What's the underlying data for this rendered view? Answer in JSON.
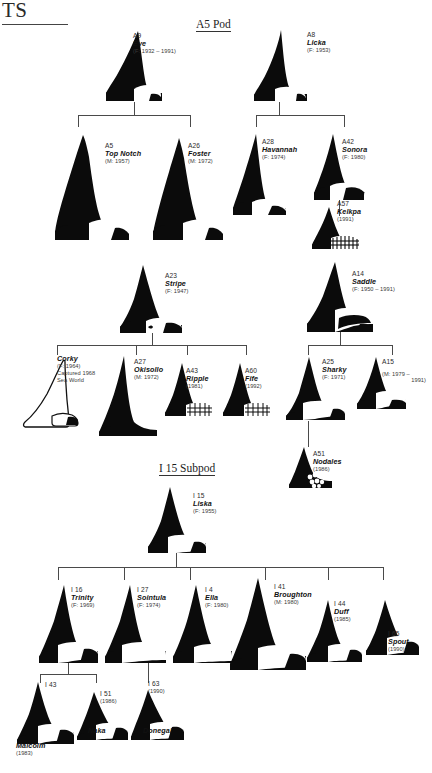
{
  "page": {
    "header_fragment": "TS",
    "section_titles": {
      "a5_pod": "A5 Pod",
      "i15_subpod": "I 15 Subpod"
    }
  },
  "whales": {
    "a9": {
      "id": "A9",
      "name": "Eve",
      "years": "(F: 1932 – 1991)"
    },
    "a8": {
      "id": "A8",
      "name": "Licka",
      "years": "(F: 1953)"
    },
    "a5": {
      "id": "A5",
      "name": "Top Notch",
      "years": "(M: 1957)"
    },
    "a26": {
      "id": "A26",
      "name": "Foster",
      "years": "(M: 1972)"
    },
    "a28": {
      "id": "A28",
      "name": "Havannah",
      "years": "(F: 1974)"
    },
    "a42": {
      "id": "A42",
      "name": "Sonora",
      "years": "(F: 1980)"
    },
    "a57": {
      "id": "A57",
      "name": "Kelkpa",
      "years": "(1991)"
    },
    "a23": {
      "id": "A23",
      "name": "Stripe",
      "years": "(F: 1947)"
    },
    "a14": {
      "id": "A14",
      "name": "Saddle",
      "years": "(F: 1950 – 1991)"
    },
    "corky": {
      "id": "",
      "name": "Corky",
      "years": "(F: 1964)",
      "note1": "Captured 1968",
      "note2": "Sea World"
    },
    "a27": {
      "id": "A27",
      "name": "Okisollo",
      "years": "(M: 1972)"
    },
    "a43": {
      "id": "A43",
      "name": "Ripple",
      "years": "(1981)"
    },
    "a60": {
      "id": "A60",
      "name": "Fife",
      "years": "(1992)"
    },
    "a25": {
      "id": "A25",
      "name": "Sharky",
      "years": "(F: 1971)"
    },
    "a15": {
      "id": "A15",
      "name": "",
      "years": "(M: 1979 –",
      "years2": "1991)"
    },
    "a51": {
      "id": "A51",
      "name": "Nodales",
      "years": "(1986)"
    },
    "i15": {
      "id": "I 15",
      "name": "Liska",
      "years": "(F: 1955)"
    },
    "i16": {
      "id": "I 16",
      "name": "Trinity",
      "years": "(F: 1969)"
    },
    "i27": {
      "id": "I 27",
      "name": "Sointula",
      "years": "(F: 1974)"
    },
    "i4": {
      "id": "I 4",
      "name": "Ella",
      "years": "(F: 1980)"
    },
    "i41": {
      "id": "I 41",
      "name": "Broughton",
      "years": "(M: 1980)"
    },
    "i44": {
      "id": "I 44",
      "name": "Duff",
      "years": "(1985)"
    },
    "i65": {
      "id": "I 65",
      "name": "Spout",
      "years": "(1990)"
    },
    "i43": {
      "id": "I 43",
      "name": "Malcolm",
      "years": "(1983)"
    },
    "i51": {
      "id": "I 51",
      "name": "Naka",
      "years": "(1986)"
    },
    "i63": {
      "id": "I 63",
      "name": "Donegal",
      "years": "(1990)"
    }
  },
  "colors": {
    "fin_fill": "#0b0b0b",
    "saddle_patch": "#ffffff",
    "line": "#4a4a4a",
    "text": "#111111"
  }
}
